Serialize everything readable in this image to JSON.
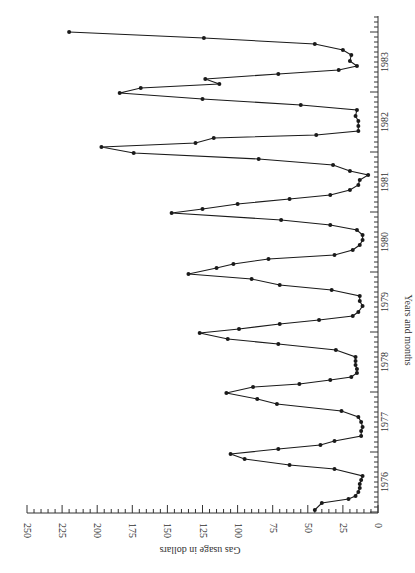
{
  "chart_data": {
    "type": "line",
    "title": "",
    "xlabel": "Years and months",
    "ylabel": "Gas usage in dollars",
    "orientation": "rotated-90 (x-axis vertical on right, y-axis horizontal at bottom)",
    "ylim": [
      0,
      250
    ],
    "y_ticks": [
      0,
      25,
      50,
      75,
      100,
      125,
      150,
      175,
      200,
      225,
      250
    ],
    "x_tick_labels": [
      "1976",
      "1977",
      "1978",
      "1979",
      "1980",
      "1981",
      "1982",
      "1983"
    ],
    "grid": false,
    "legend": null,
    "series": [
      {
        "name": "Gas usage",
        "points": [
          {
            "month_index": 0.4,
            "value": 45
          },
          {
            "month_index": 1.8,
            "value": 40
          },
          {
            "month_index": 2.6,
            "value": 21
          },
          {
            "month_index": 3.2,
            "value": 16
          },
          {
            "month_index": 4.0,
            "value": 14
          },
          {
            "month_index": 4.8,
            "value": 13
          },
          {
            "month_index": 5.6,
            "value": 13
          },
          {
            "month_index": 6.4,
            "value": 12
          },
          {
            "month_index": 7.2,
            "value": 11
          },
          {
            "month_index": 8.6,
            "value": 31
          },
          {
            "month_index": 9.4,
            "value": 63
          },
          {
            "month_index": 10.6,
            "value": 95
          },
          {
            "month_index": 11.6,
            "value": 105
          },
          {
            "month_index": 12.6,
            "value": 71
          },
          {
            "month_index": 13.4,
            "value": 41
          },
          {
            "month_index": 14.2,
            "value": 31
          },
          {
            "month_index": 15.2,
            "value": 12
          },
          {
            "month_index": 16.2,
            "value": 12
          },
          {
            "month_index": 17.0,
            "value": 11
          },
          {
            "month_index": 18.0,
            "value": 12
          },
          {
            "month_index": 19.0,
            "value": 14
          },
          {
            "month_index": 20.2,
            "value": 26
          },
          {
            "month_index": 21.6,
            "value": 72
          },
          {
            "month_index": 22.6,
            "value": 86
          },
          {
            "month_index": 23.8,
            "value": 108
          },
          {
            "month_index": 25.0,
            "value": 89
          },
          {
            "month_index": 25.6,
            "value": 56
          },
          {
            "month_index": 26.4,
            "value": 34
          },
          {
            "month_index": 27.0,
            "value": 19
          },
          {
            "month_index": 27.8,
            "value": 15
          },
          {
            "month_index": 28.6,
            "value": 15
          },
          {
            "month_index": 29.4,
            "value": 16
          },
          {
            "month_index": 30.2,
            "value": 16
          },
          {
            "month_index": 31.0,
            "value": 16
          },
          {
            "month_index": 32.4,
            "value": 30
          },
          {
            "month_index": 33.6,
            "value": 71
          },
          {
            "month_index": 34.6,
            "value": 107
          },
          {
            "month_index": 35.8,
            "value": 127
          },
          {
            "month_index": 36.6,
            "value": 99
          },
          {
            "month_index": 37.6,
            "value": 70
          },
          {
            "month_index": 38.4,
            "value": 42
          },
          {
            "month_index": 39.2,
            "value": 18
          },
          {
            "month_index": 40.0,
            "value": 14
          },
          {
            "month_index": 41.2,
            "value": 11
          },
          {
            "month_index": 42.2,
            "value": 13
          },
          {
            "month_index": 43.2,
            "value": 13
          },
          {
            "month_index": 44.4,
            "value": 33
          },
          {
            "month_index": 45.4,
            "value": 70
          },
          {
            "month_index": 46.6,
            "value": 90
          },
          {
            "month_index": 47.6,
            "value": 135
          },
          {
            "month_index": 48.8,
            "value": 115
          },
          {
            "month_index": 49.6,
            "value": 103
          },
          {
            "month_index": 50.6,
            "value": 78
          },
          {
            "month_index": 51.4,
            "value": 31
          },
          {
            "month_index": 52.4,
            "value": 18
          },
          {
            "month_index": 53.4,
            "value": 13
          },
          {
            "month_index": 54.4,
            "value": 11
          },
          {
            "month_index": 55.4,
            "value": 11
          },
          {
            "month_index": 56.4,
            "value": 15
          },
          {
            "month_index": 57.4,
            "value": 34
          },
          {
            "month_index": 58.4,
            "value": 69
          },
          {
            "month_index": 59.8,
            "value": 147
          },
          {
            "month_index": 60.6,
            "value": 125
          },
          {
            "month_index": 61.6,
            "value": 100
          },
          {
            "month_index": 62.6,
            "value": 63
          },
          {
            "month_index": 63.4,
            "value": 34
          },
          {
            "month_index": 64.4,
            "value": 20
          },
          {
            "month_index": 65.4,
            "value": 14
          },
          {
            "month_index": 66.4,
            "value": 13
          },
          {
            "month_index": 67.4,
            "value": 7
          },
          {
            "month_index": 68.2,
            "value": 20
          },
          {
            "month_index": 69.4,
            "value": 32
          },
          {
            "month_index": 70.6,
            "value": 85
          },
          {
            "month_index": 71.8,
            "value": 174
          },
          {
            "month_index": 73.0,
            "value": 197
          },
          {
            "month_index": 73.8,
            "value": 130
          },
          {
            "month_index": 74.8,
            "value": 117
          },
          {
            "month_index": 75.4,
            "value": 44
          },
          {
            "month_index": 76.2,
            "value": 14
          },
          {
            "month_index": 77.2,
            "value": 14
          },
          {
            "month_index": 78.2,
            "value": 14
          },
          {
            "month_index": 79.2,
            "value": 16
          },
          {
            "month_index": 80.4,
            "value": 15
          },
          {
            "month_index": 81.4,
            "value": 55
          },
          {
            "month_index": 82.6,
            "value": 125
          },
          {
            "month_index": 83.8,
            "value": 184
          },
          {
            "month_index": 84.8,
            "value": 169
          },
          {
            "month_index": 85.6,
            "value": 113
          },
          {
            "month_index": 86.6,
            "value": 123
          },
          {
            "month_index": 87.6,
            "value": 71
          },
          {
            "month_index": 88.4,
            "value": 28
          },
          {
            "month_index": 89.2,
            "value": 15
          },
          {
            "month_index": 90.2,
            "value": 20
          },
          {
            "month_index": 91.4,
            "value": 19
          },
          {
            "month_index": 92.4,
            "value": 25
          },
          {
            "month_index": 93.6,
            "value": 45
          },
          {
            "month_index": 94.8,
            "value": 124
          },
          {
            "month_index": 96.0,
            "value": 220
          }
        ]
      }
    ]
  },
  "layout": {
    "line_color": "#1a1a1a",
    "axis_color": "#333333"
  }
}
